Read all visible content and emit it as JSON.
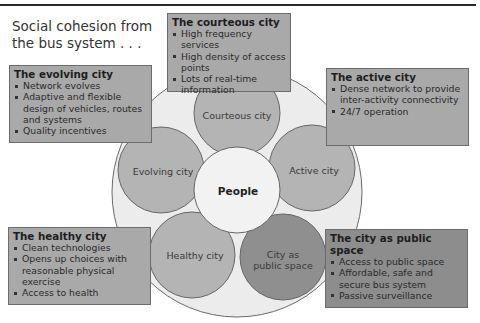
{
  "title": "Social cohesion from\nthe bus system . . .",
  "diagram": {
    "center": {
      "label": "People",
      "color": "#f2f2f2"
    },
    "outer_ring_color": "#ececec",
    "circles": [
      {
        "id": "courteous",
        "label": "Courteous city",
        "color": "#b4b4b4"
      },
      {
        "id": "active",
        "label": "Active city",
        "color": "#b4b4b4"
      },
      {
        "id": "public",
        "label": "City as\npublic space",
        "color": "#8f8f8f"
      },
      {
        "id": "healthy",
        "label": "Healthy city",
        "color": "#b4b4b4"
      },
      {
        "id": "evolving",
        "label": "Evolving city",
        "color": "#b4b4b4"
      }
    ]
  },
  "boxes": {
    "courteous": {
      "title": "The courteous city",
      "items": [
        "High frequency services",
        "High density of access points",
        "Lots of real-time information"
      ]
    },
    "evolving": {
      "title": "The evolving city",
      "items": [
        "Network evolves",
        "Adaptive and flexible design of vehicles, routes and systems",
        "Quality incentives"
      ]
    },
    "active": {
      "title": "The active city",
      "items": [
        "Dense network to provide inter-activity connectivity",
        "24/7 operation"
      ]
    },
    "healthy": {
      "title": "The healthy city",
      "items": [
        "Clean technologies",
        "Opens up choices with reasonable physical exercise",
        "Access to health"
      ]
    },
    "public": {
      "title": "The city as public space",
      "items": [
        "Access to public space",
        "Affordable, safe and secure bus system",
        "Passive surveillance"
      ]
    }
  }
}
